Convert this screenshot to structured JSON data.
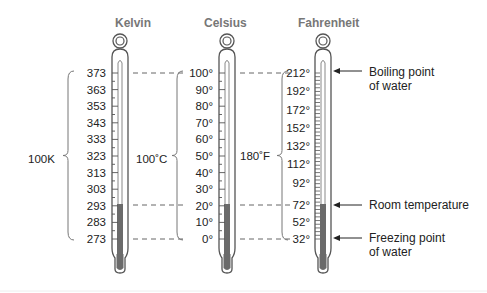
{
  "titles": {
    "kelvin": "Kelvin",
    "celsius": "Celsius",
    "fahrenheit": "Fahrenheit"
  },
  "kelvin_ticks": [
    "373",
    "363",
    "353",
    "343",
    "333",
    "323",
    "313",
    "303",
    "293",
    "283",
    "273"
  ],
  "celsius_ticks": [
    "100°",
    "90°",
    "80°",
    "70°",
    "60°",
    "50°",
    "40°",
    "30°",
    "20°",
    "10°",
    "0°"
  ],
  "fahrenheit_ticks": [
    "212°",
    "192°",
    "172°",
    "152°",
    "132°",
    "112°",
    "92°",
    "72°",
    "52°",
    "32°"
  ],
  "brace_labels": {
    "kelvin": "100K",
    "celsius": "100˚C",
    "fahrenheit": "180˚F"
  },
  "annotations": {
    "boiling": "Boiling point\nof water",
    "room": "Room temperature",
    "freezing": "Freezing point\nof water"
  },
  "colors": {
    "outline": "#555555",
    "mercury": "#6b6b6b",
    "title": "#777777",
    "dash": "#666666"
  }
}
